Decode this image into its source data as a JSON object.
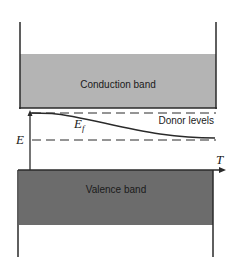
{
  "diagram": {
    "type": "energy-band-diagram",
    "conduction_band": {
      "label": "Conduction band",
      "color": "#b4b4b4"
    },
    "valence_band": {
      "label": "Valence band",
      "color": "#6c6c6c"
    },
    "donor_levels": {
      "label": "Donor levels"
    },
    "fermi_level": {
      "symbol": "E",
      "subscript": "f"
    },
    "energy_axis": {
      "label": "E"
    },
    "temperature_axis": {
      "label": "T"
    },
    "line_color": "#2a2a2a"
  }
}
